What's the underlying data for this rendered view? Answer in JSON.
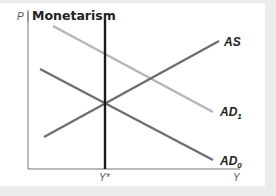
{
  "diagram": {
    "title": "Monetarism",
    "y_axis_label": "P",
    "x_axis_label": "Y",
    "potential_output_label": "Y*",
    "colors": {
      "axis": "#777777",
      "potential_output_line": "#1a1a1a",
      "AS": "#6e6e6e",
      "AD0": "#6e6e6e",
      "AD1": "#b5b5b5",
      "panel_background": "#ffffff",
      "page_background": "#ececec"
    },
    "curves": [
      {
        "id": "AS",
        "label_main": "AS",
        "label_sub": "",
        "slope": "upward"
      },
      {
        "id": "AD1",
        "label_main": "AD",
        "label_sub": "1",
        "slope": "downward"
      },
      {
        "id": "AD0",
        "label_main": "AD",
        "label_sub": "0",
        "slope": "downward"
      }
    ]
  }
}
